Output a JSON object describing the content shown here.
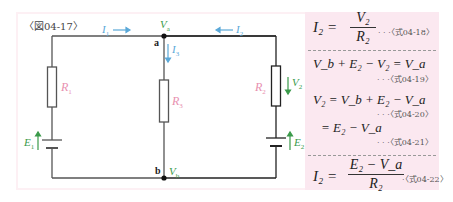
{
  "figure": {
    "label": "〈図04-17〉",
    "colors": {
      "wire": "#555555",
      "current": "#5aa8d8",
      "voltage": "#3a9a4a",
      "resistor_label": "#e890b0",
      "panel_bg": "#fbe8f0"
    }
  },
  "circuit": {
    "currents": {
      "i1": "I",
      "i1_sub": "1",
      "i2": "I",
      "i2_sub": "2",
      "i3": "I",
      "i3_sub": "3"
    },
    "nodes": {
      "a": "a",
      "b": "b",
      "va": "V",
      "va_sub": "a",
      "vb": "V",
      "vb_sub": "b"
    },
    "resistors": {
      "r1": "R",
      "r1_sub": "1",
      "r2": "R",
      "r2_sub": "2",
      "r3": "R",
      "r3_sub": "3"
    },
    "sources": {
      "e1": "E",
      "e1_sub": "1",
      "e2": "E",
      "e2_sub": "2"
    },
    "voltages": {
      "v2": "V",
      "v2_sub": "2"
    }
  },
  "formulas": [
    {
      "id": "04-18",
      "lhs": "I₂ =",
      "num": "V₂",
      "den": "R₂",
      "ref": "· · ·〈式04-18〉"
    },
    {
      "id": "04-19",
      "text": "V_b + E₂ − V₂ = V_a",
      "ref": "· · ·〈式04-19〉"
    },
    {
      "id": "04-20",
      "text": "V₂ = V_b + E₂ − V_a",
      "ref": "· · ·〈式04-20〉"
    },
    {
      "id": "04-21",
      "text": "= E₂ − V_a",
      "ref": "· · ·〈式04-21〉"
    },
    {
      "id": "04-22",
      "lhs": "I₂ =",
      "num": "E₂ − V_a",
      "den": "R₂",
      "ref": "·〈式04-22〉"
    }
  ]
}
